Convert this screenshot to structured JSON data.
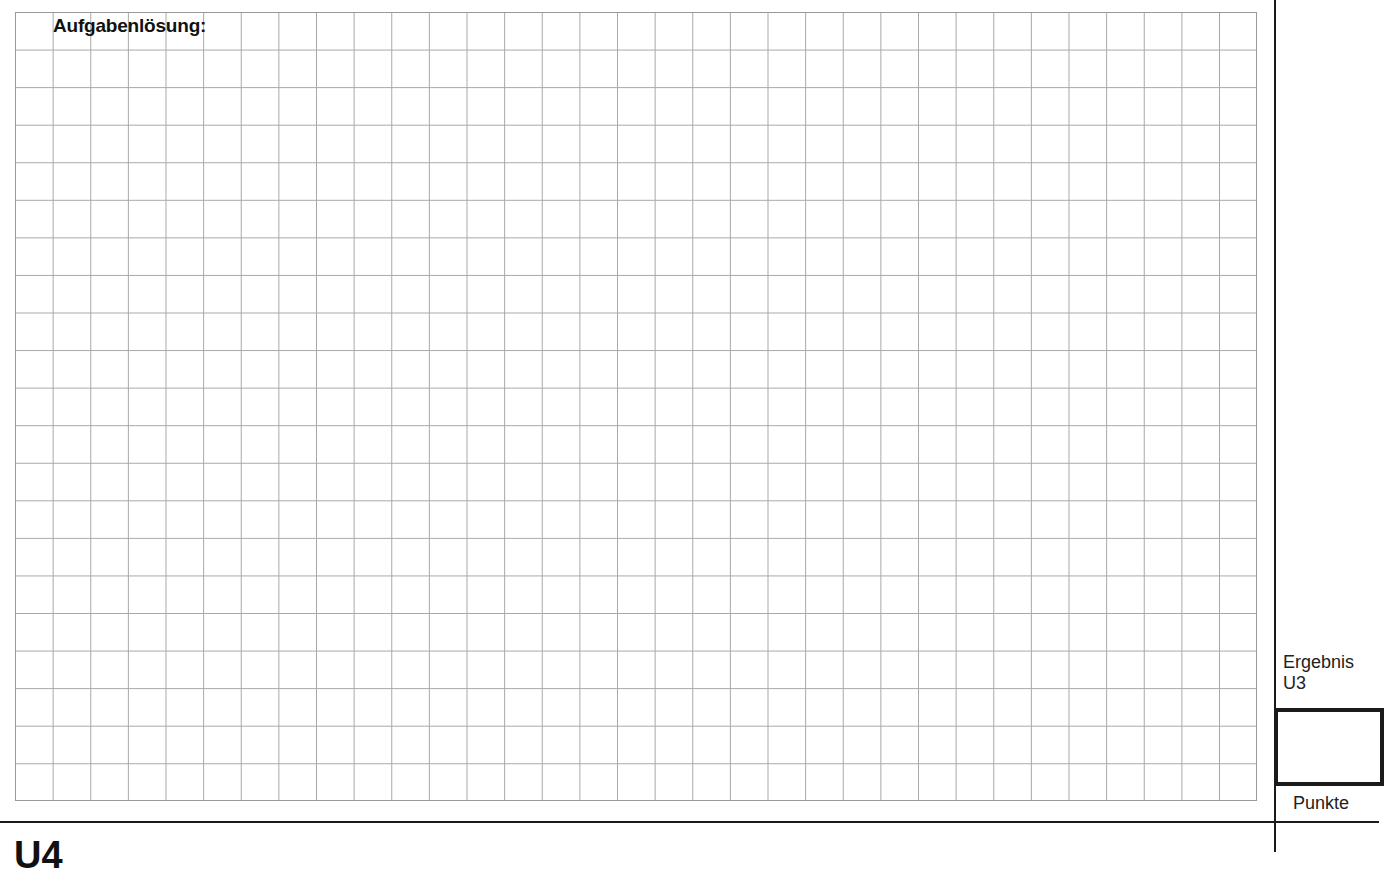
{
  "worksheet": {
    "solution_heading": "Aufgabenlösung:",
    "grid": {
      "columns": 33,
      "rows": 21,
      "line_color": "#a8a8a8"
    }
  },
  "sidebar": {
    "result_label_line1": "Ergebnis",
    "result_label_line2": "U3",
    "score_box_value": "",
    "points_label": "Punkte"
  },
  "next_section": {
    "label": "U4"
  }
}
